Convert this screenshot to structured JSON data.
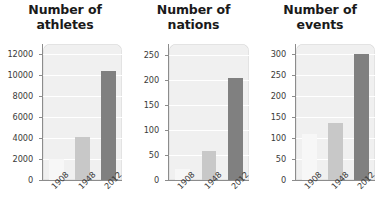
{
  "figure": {
    "background_color": "#ffffff",
    "width": 383,
    "height": 220
  },
  "style": {
    "plot_background": "#f0f0f0",
    "gridline_color": "#ffffff",
    "axis_color": "#8c8c8c",
    "title_color": "#1a1a1a",
    "tick_label_color": "#3a3a3a",
    "bar_colors": {
      "1908": "#f7f7f7",
      "1948": "#c8c8c8",
      "2012": "#808080"
    }
  },
  "charts": [
    {
      "id": "athletes",
      "title": "Number of\nathletes",
      "title_line1": "Number of",
      "title_line2": "athletes",
      "chart_data": {
        "type": "bar",
        "title": "Number of athletes",
        "xlabel": "",
        "ylabel": "",
        "categories": [
          "1908",
          "1948",
          "2012"
        ],
        "values": [
          2008,
          4104,
          10400
        ],
        "ylim": [
          0,
          13000
        ],
        "yticks": [
          0,
          2000,
          4000,
          6000,
          8000,
          10000,
          12000
        ],
        "ytick_labels": [
          "0",
          "2000",
          "4000",
          "6000",
          "8000",
          "10000",
          "12000"
        ],
        "grid": true,
        "legend": false,
        "bar_colors": [
          "#f7f7f7",
          "#c8c8c8",
          "#808080"
        ]
      }
    },
    {
      "id": "nations",
      "title": "Number of\nnations",
      "title_line1": "Number of",
      "title_line2": "nations",
      "chart_data": {
        "type": "bar",
        "title": "Number of nations",
        "xlabel": "",
        "ylabel": "",
        "categories": [
          "1908",
          "1948",
          "2012"
        ],
        "values": [
          22,
          59,
          204
        ],
        "ylim": [
          0,
          272
        ],
        "yticks": [
          0,
          50,
          100,
          150,
          200,
          250
        ],
        "ytick_labels": [
          "0",
          "50",
          "100",
          "150",
          "200",
          "250"
        ],
        "grid": true,
        "legend": false,
        "bar_colors": [
          "#f7f7f7",
          "#c8c8c8",
          "#808080"
        ]
      }
    },
    {
      "id": "events",
      "title": "Number of\nevents",
      "title_line1": "Number of",
      "title_line2": "events",
      "chart_data": {
        "type": "bar",
        "title": "Number of events",
        "xlabel": "",
        "ylabel": "",
        "categories": [
          "1908",
          "1948",
          "2012"
        ],
        "values": [
          110,
          136,
          302
        ],
        "ylim": [
          0,
          325
        ],
        "yticks": [
          0,
          50,
          100,
          150,
          200,
          250,
          300
        ],
        "ytick_labels": [
          "0",
          "50",
          "100",
          "150",
          "200",
          "250",
          "300"
        ],
        "grid": true,
        "legend": false,
        "bar_colors": [
          "#f7f7f7",
          "#c8c8c8",
          "#808080"
        ]
      }
    }
  ]
}
